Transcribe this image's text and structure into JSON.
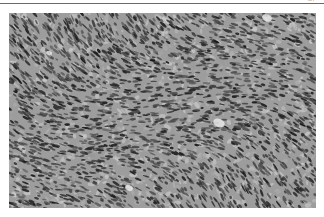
{
  "page": {
    "page_number": "37"
  },
  "figure": {
    "kind": "micrograph",
    "tone": "grayscale",
    "colors": {
      "background": "#9d9d9d",
      "nucleus": "#2a2a2a",
      "stroma_light": "#c8c8c8"
    }
  }
}
